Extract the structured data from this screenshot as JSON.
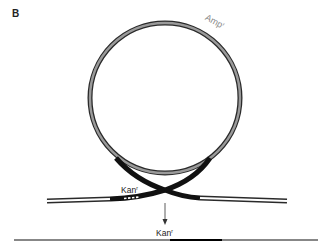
{
  "panel": {
    "label": "B"
  },
  "labels": {
    "amp": "Amp",
    "amp_sup": "r",
    "kan_insert": "Kan",
    "kan_insert_sup": "r",
    "kan_result": "Kan",
    "kan_result_sup": "r"
  },
  "colors": {
    "strand_outline": "#2a2a2a",
    "plasmid_fill": "#9a9a9a",
    "homology_region": "#111111",
    "chromosome_fill": "#ffffff",
    "amp_label": "#8a8a8a",
    "text": "#222222"
  }
}
